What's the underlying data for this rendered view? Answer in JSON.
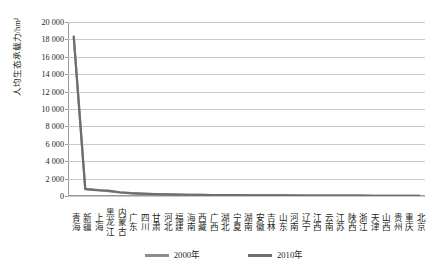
{
  "chart_data": {
    "type": "line",
    "title": "",
    "xlabel": "",
    "ylabel": "人均生态承载力/hm²",
    "ylim": [
      0,
      20000
    ],
    "ytick_step": 2000,
    "ytick_labels": [
      "20 000",
      "18 000",
      "16 000",
      "14 000",
      "12 000",
      "10 000",
      "8 000",
      "6 000",
      "4 000",
      "2 000",
      "0"
    ],
    "ytick_values": [
      20000,
      18000,
      16000,
      14000,
      12000,
      10000,
      8000,
      6000,
      4000,
      2000,
      0
    ],
    "grid": true,
    "legend_position": "bottom-center",
    "categories": [
      "青海",
      "新疆",
      "上海",
      "黑龙江",
      "内蒙古",
      "广东",
      "四川",
      "甘肃",
      "河北",
      "福建",
      "海南",
      "西藏",
      "广西",
      "湖北",
      "宁夏",
      "湖南",
      "安徽",
      "吉林",
      "山东",
      "河南",
      "辽宁",
      "江西",
      "云南",
      "江苏",
      "陕西",
      "浙江",
      "天津",
      "山西",
      "贵州",
      "重庆",
      "北京"
    ],
    "series": [
      {
        "name": "2000年",
        "color": "#8d8d8d",
        "values": [
          18350,
          820,
          700,
          560,
          400,
          300,
          250,
          210,
          180,
          160,
          140,
          125,
          112,
          100,
          92,
          85,
          78,
          72,
          66,
          60,
          55,
          50,
          46,
          42,
          38,
          34,
          30,
          27,
          24,
          20,
          16
        ]
      },
      {
        "name": "2010年",
        "color": "#6e6e6e",
        "values": [
          18250,
          780,
          660,
          620,
          430,
          320,
          262,
          220,
          190,
          168,
          146,
          130,
          116,
          104,
          95,
          88,
          81,
          74,
          68,
          62,
          57,
          52,
          47,
          43,
          39,
          35,
          31,
          28,
          25,
          21,
          17
        ]
      }
    ]
  },
  "legend": {
    "items": [
      {
        "label": "2000年",
        "color": "#8d8d8d"
      },
      {
        "label": "2010年",
        "color": "#6e6e6e"
      }
    ]
  },
  "axes": {
    "y_title": "人均生态承载力/hm²"
  }
}
